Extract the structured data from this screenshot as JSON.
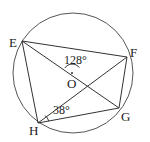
{
  "diagram": {
    "type": "circle-geometry",
    "circle": {
      "center": "O",
      "cx": 73,
      "cy": 73,
      "r": 60
    },
    "points": {
      "E": {
        "label": "E",
        "x": 22,
        "y": 41
      },
      "F": {
        "label": "F",
        "x": 127,
        "y": 57
      },
      "G": {
        "label": "G",
        "x": 119,
        "y": 108
      },
      "H": {
        "label": "H",
        "x": 38,
        "y": 123
      },
      "O": {
        "label": "O",
        "x": 72,
        "y": 73
      }
    },
    "segments": [
      "EF",
      "FG",
      "GH",
      "HE",
      "EG",
      "HF"
    ],
    "angles": [
      {
        "label": "128°",
        "vertex": "O",
        "between": [
          "E",
          "F"
        ]
      },
      {
        "label": "38°",
        "vertex": "H",
        "between": [
          "O",
          "G"
        ]
      }
    ],
    "stroke_color": "#333333"
  }
}
